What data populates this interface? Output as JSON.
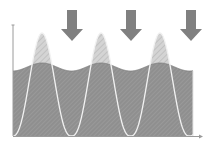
{
  "diagram": {
    "title": "",
    "colors": {
      "background": "#ffffff",
      "axis": "#9a9a9a",
      "peak_fill": "#d4d4d4",
      "peak_hatch": "#bdbdbd",
      "base_fill": "#8f8f8f",
      "base_hatch": "#a3a3a3",
      "curve_line": "#f2f2f2",
      "arrow": "#808080"
    },
    "axes": {
      "origin": [
        13,
        136
      ],
      "y_top": 25,
      "x_end": 200,
      "x_label": "",
      "y_label": ""
    },
    "peaks": [
      {
        "center_x": 42,
        "top_y": 33
      },
      {
        "center_x": 101,
        "top_y": 33
      },
      {
        "center_x": 160,
        "top_y": 33
      }
    ],
    "troughs_x": [
      72,
      131,
      193
    ],
    "base_region": {
      "top_at_peaks_y": 63,
      "top_at_troughs_y": 71,
      "bottom_y": 136
    },
    "arrows": [
      {
        "x": 72,
        "top_y": 10,
        "tip_y": 41
      },
      {
        "x": 131,
        "top_y": 10,
        "tip_y": 41
      },
      {
        "x": 191,
        "top_y": 10,
        "tip_y": 41
      }
    ]
  }
}
